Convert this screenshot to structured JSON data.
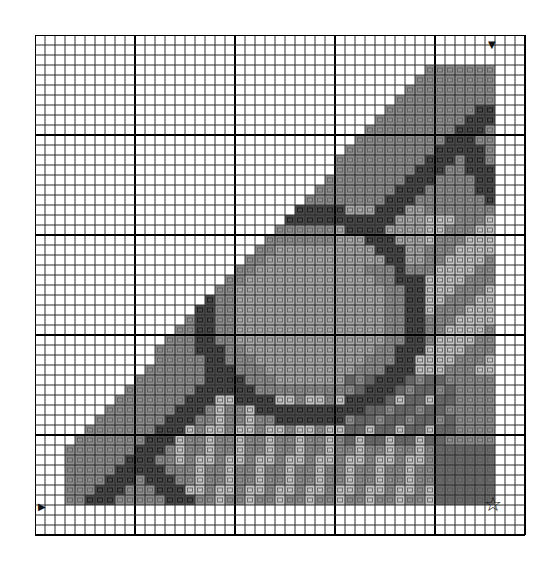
{
  "chart": {
    "cols": 49,
    "rows": 50,
    "cell_size": 10,
    "major_every": 10,
    "colors": {
      "empty": "#ffffff",
      "grid_minor": "#2a2a2a",
      "grid_major": "#000000"
    },
    "symbols": [
      {
        "key": "M",
        "name": "medium-gray",
        "fill": "#8e8e8e",
        "glyph": "="
      },
      {
        "key": "D",
        "name": "dark-gray",
        "fill": "#4a4a4a",
        "glyph": "\\"
      },
      {
        "key": "O",
        "name": "light-medium-gray",
        "fill": "#a9a9a9",
        "glyph": "o"
      },
      {
        "key": "L",
        "name": "light-gray",
        "fill": "#c4c4c4",
        "glyph": "::"
      },
      {
        "key": "X",
        "name": "dark-medium-gray",
        "fill": "#6a6a6a",
        "glyph": "x"
      }
    ]
  },
  "markers": {
    "top_arrow": {
      "glyph": "▼",
      "col": 46
    },
    "left_arrow": {
      "glyph": "▶",
      "row": 47
    },
    "center_star": {
      "glyph": "☆"
    }
  }
}
